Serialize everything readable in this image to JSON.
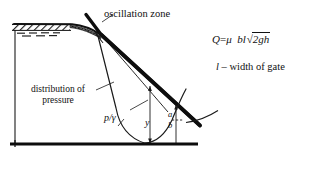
{
  "figure": {
    "title_labels": {
      "oscillation_zone": "oscillation zone",
      "distribution_of_pressure": "distribution of pressure",
      "p_gamma": "p/γ",
      "y": "y",
      "a": "a",
      "b": "b"
    },
    "formula": {
      "discharge_lhs": "Q",
      "equals": "=",
      "mu": "μ",
      "bl": "bl",
      "radical_sign": "√",
      "radicand": "2gh",
      "full_text": "Q = μ bl√2gh"
    },
    "note": {
      "symbol": "l",
      "dash": "–",
      "text": "width of gate",
      "full_text": "l – width of gate"
    },
    "colors": {
      "ink": "#111111",
      "background": "#ffffff",
      "hatch": "#1a1a1a"
    },
    "elements": {
      "gate_line": "thick-diagonal-gate-profile",
      "pressure_curve": "thin-pressure-distribution-curve",
      "ground_line": "thick-horizontal-ground-line",
      "water_surface": "hatched-water-surface-band",
      "oscillation_wedge": "dark-crosshatched-wedge"
    }
  }
}
